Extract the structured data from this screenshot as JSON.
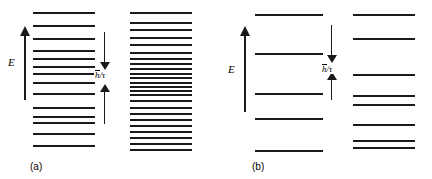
{
  "figure": {
    "kind": "energy-level-diagram",
    "background_color": "#ffffff",
    "line_color": "#1a1a1a",
    "width": 432,
    "height": 179
  },
  "panels": [
    {
      "id": "a",
      "caption": "(a)",
      "axis": {
        "label": "E",
        "meaning": "energy-increasing-upward"
      },
      "annotation": {
        "label_numerator": "h",
        "label_denominator": "τ",
        "label_text": "h̅/τ",
        "style": "double-headed-vertical-arrow",
        "description": "level-width h-bar over tau"
      },
      "left_column": {
        "name": "sparse-level-stack",
        "level_count": 14,
        "levels_y": [
          12,
          25,
          38,
          50,
          58,
          66,
          73,
          82,
          93,
          107,
          116,
          122,
          133,
          145
        ]
      },
      "right_column": {
        "name": "dense-level-stack",
        "level_count": 24,
        "levels_y": [
          12,
          22,
          29,
          37,
          44,
          52,
          58,
          63,
          68,
          73,
          77,
          82,
          86,
          90,
          94,
          100,
          107,
          113,
          119,
          125,
          131,
          137,
          143,
          149
        ]
      }
    },
    {
      "id": "b",
      "caption": "(b)",
      "axis": {
        "label": "E",
        "meaning": "energy-increasing-upward"
      },
      "annotation": {
        "label_numerator": "h",
        "label_denominator": "τ",
        "label_text": "h̅/τ",
        "style": "double-headed-vertical-arrow",
        "description": "level-width h-bar over tau"
      },
      "left_column": {
        "name": "sparse-level-stack",
        "level_count": 5,
        "levels_y": [
          14,
          53,
          93,
          118,
          150
        ]
      },
      "right_column": {
        "name": "sparse-level-stack",
        "level_count": 8,
        "levels_y": [
          14,
          38,
          74,
          95,
          104,
          124,
          140,
          147
        ]
      }
    }
  ]
}
